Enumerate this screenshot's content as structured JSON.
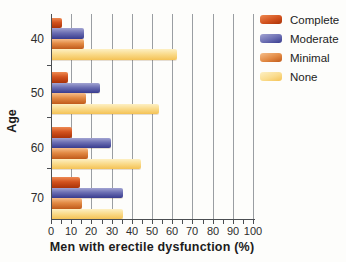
{
  "chart_data": {
    "type": "bar",
    "orientation": "horizontal",
    "title": "",
    "xlabel": "Men with erectile dysfunction (%)",
    "ylabel": "Age",
    "xlim": [
      0,
      100
    ],
    "x_ticks": [
      0,
      10,
      20,
      30,
      40,
      50,
      60,
      70,
      80,
      90,
      100
    ],
    "minor_tick_step": 5,
    "grid": "vertical",
    "legend_position": "top-right",
    "categories": [
      "40",
      "50",
      "60",
      "70"
    ],
    "series": [
      {
        "name": "Complete",
        "values": [
          5,
          8,
          10,
          14
        ],
        "color_light": "#ee8a52",
        "color_mid": "#d2521e",
        "color_dark": "#a93208"
      },
      {
        "name": "Moderate",
        "values": [
          16,
          24,
          29,
          35
        ],
        "color_light": "#a2a4d2",
        "color_mid": "#6b6eb2",
        "color_dark": "#383b8e"
      },
      {
        "name": "Minimal",
        "values": [
          16,
          17,
          18,
          15
        ],
        "color_light": "#f6be8a",
        "color_mid": "#e28a44",
        "color_dark": "#c05a1a"
      },
      {
        "name": "None",
        "values": [
          62,
          53,
          44,
          35
        ],
        "color_light": "#fdf0c4",
        "color_mid": "#fadc8e",
        "color_dark": "#f4c255"
      }
    ],
    "colors": {
      "gridline": "#9a9ea2",
      "axis": "#4b4e52",
      "text": "#2d2d2d"
    }
  }
}
